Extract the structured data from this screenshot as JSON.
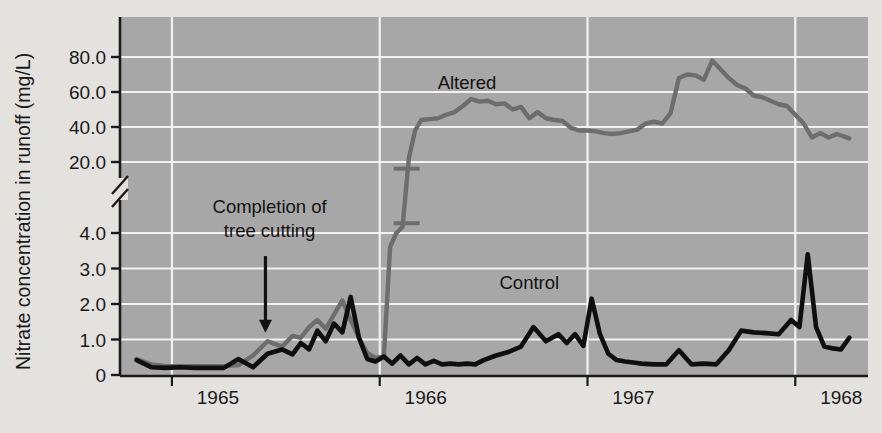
{
  "chart_data": {
    "type": "line",
    "title": "",
    "xlabel": "",
    "ylabel": "Nitrate concentration in runoff (mg/L)",
    "grid": true,
    "legend_position": "inline-labels",
    "broken_axis": true,
    "y_lower_segment": [
      0,
      4
    ],
    "y_upper_segment": [
      20,
      80
    ],
    "ylim": [
      0,
      80
    ],
    "xlim": [
      1964.75,
      1968.35
    ],
    "y_ticks_lower": [
      "0",
      "1.0",
      "2.0",
      "3.0",
      "4.0"
    ],
    "y_ticks_upper": [
      "20.0",
      "40.0",
      "60.0",
      "80.0"
    ],
    "y_tick_values_lower": [
      0,
      1,
      2,
      3,
      4
    ],
    "y_tick_values_upper": [
      20,
      40,
      60,
      80
    ],
    "x_ticks": [
      "1965",
      "1966",
      "1967",
      "1968"
    ],
    "x_tick_values": [
      1965.0,
      1966.0,
      1967.0,
      1968.0
    ],
    "background_color": "#a7a7a7",
    "grid_color": "#f2f2f2",
    "page_color": "#e3e2df",
    "series": [
      {
        "name": "Altered",
        "color": "#6d6d6d",
        "label_x": 1966.42,
        "label_y": 62.0,
        "x": [
          1964.83,
          1964.9,
          1964.97,
          1965.04,
          1965.11,
          1965.18,
          1965.25,
          1965.32,
          1965.39,
          1965.46,
          1965.53,
          1965.58,
          1965.62,
          1965.66,
          1965.7,
          1965.74,
          1965.78,
          1965.82,
          1965.86,
          1965.9,
          1965.94,
          1965.98,
          1966.02,
          1966.05,
          1966.08,
          1966.11,
          1966.14,
          1966.17,
          1966.2,
          1966.24,
          1966.28,
          1966.32,
          1966.36,
          1966.4,
          1966.44,
          1966.48,
          1966.52,
          1966.56,
          1966.6,
          1966.64,
          1966.68,
          1966.72,
          1966.76,
          1966.8,
          1966.84,
          1966.88,
          1966.92,
          1966.96,
          1967.0,
          1967.04,
          1967.08,
          1967.12,
          1967.16,
          1967.2,
          1967.24,
          1967.28,
          1967.32,
          1967.36,
          1967.4,
          1967.44,
          1967.48,
          1967.52,
          1967.56,
          1967.6,
          1967.64,
          1967.68,
          1967.72,
          1967.76,
          1967.8,
          1967.84,
          1967.88,
          1967.92,
          1967.96,
          1968.0,
          1968.04,
          1968.08,
          1968.12,
          1968.16,
          1968.2,
          1968.26
        ],
        "y": [
          0.45,
          0.3,
          0.25,
          0.25,
          0.25,
          0.25,
          0.25,
          0.28,
          0.55,
          0.95,
          0.8,
          1.1,
          1.05,
          1.35,
          1.55,
          1.3,
          1.7,
          2.1,
          1.55,
          1.05,
          0.62,
          0.48,
          0.52,
          3.6,
          4.0,
          5.4,
          22.0,
          38.0,
          44.0,
          44.5,
          45.0,
          47.0,
          48.5,
          52.0,
          56.0,
          54.5,
          55.0,
          53.0,
          53.5,
          50.0,
          51.5,
          45.0,
          48.5,
          45.0,
          44.0,
          43.5,
          39.5,
          38.0,
          38.0,
          37.5,
          36.5,
          36.0,
          36.5,
          37.5,
          38.5,
          42.0,
          43.0,
          42.0,
          48.0,
          68.0,
          70.0,
          69.5,
          67.0,
          78.0,
          73.0,
          68.0,
          64.0,
          62.0,
          58.0,
          57.0,
          55.0,
          53.0,
          52.0,
          47.0,
          42.0,
          34.0,
          36.5,
          34.0,
          36.0,
          33.5
        ],
        "break_marker_x": 1966.13,
        "break_marker_y_upper": 18.5,
        "break_marker_y_lower": 6.2
      },
      {
        "name": "Control",
        "color": "#0f0f0f",
        "label_x": 1966.72,
        "label_y": 2.42,
        "x": [
          1964.83,
          1964.9,
          1964.97,
          1965.04,
          1965.11,
          1965.18,
          1965.25,
          1965.32,
          1965.39,
          1965.46,
          1965.53,
          1965.58,
          1965.62,
          1965.66,
          1965.7,
          1965.74,
          1965.78,
          1965.82,
          1965.86,
          1965.9,
          1965.94,
          1965.98,
          1966.02,
          1966.06,
          1966.1,
          1966.14,
          1966.18,
          1966.22,
          1966.26,
          1966.3,
          1966.34,
          1966.38,
          1966.42,
          1966.46,
          1966.5,
          1966.56,
          1966.62,
          1966.68,
          1966.74,
          1966.8,
          1966.86,
          1966.9,
          1966.94,
          1966.98,
          1967.02,
          1967.06,
          1967.1,
          1967.14,
          1967.18,
          1967.22,
          1967.26,
          1967.32,
          1967.38,
          1967.44,
          1967.5,
          1967.56,
          1967.62,
          1967.68,
          1967.74,
          1967.8,
          1967.86,
          1967.92,
          1967.98,
          1968.02,
          1968.06,
          1968.1,
          1968.14,
          1968.18,
          1968.22,
          1968.26
        ],
        "y": [
          0.42,
          0.22,
          0.2,
          0.22,
          0.2,
          0.2,
          0.2,
          0.45,
          0.22,
          0.6,
          0.72,
          0.58,
          0.9,
          0.72,
          1.25,
          0.95,
          1.45,
          1.2,
          2.2,
          1.05,
          0.45,
          0.38,
          0.52,
          0.32,
          0.55,
          0.3,
          0.48,
          0.3,
          0.4,
          0.3,
          0.32,
          0.3,
          0.32,
          0.3,
          0.42,
          0.55,
          0.65,
          0.8,
          1.35,
          0.95,
          1.15,
          0.9,
          1.15,
          0.82,
          2.15,
          1.15,
          0.6,
          0.42,
          0.38,
          0.35,
          0.32,
          0.3,
          0.3,
          0.7,
          0.3,
          0.32,
          0.3,
          0.7,
          1.25,
          1.2,
          1.18,
          1.15,
          1.55,
          1.35,
          3.4,
          1.35,
          0.8,
          0.75,
          0.72,
          1.05
        ]
      }
    ],
    "annotations": [
      {
        "text_line1": "Completion of",
        "text_line2": "tree cutting",
        "arrow_x": 1965.45,
        "arrow_y_from": 3.35,
        "arrow_y_to": 1.25,
        "text_x": 1965.47,
        "text_y": 4.35
      }
    ]
  }
}
